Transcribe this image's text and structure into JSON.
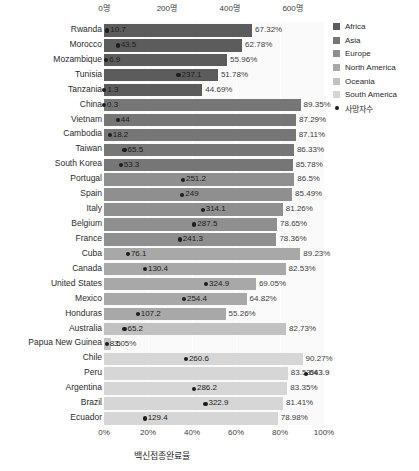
{
  "chart_data": {
    "type": "bar",
    "title": "",
    "xlabel": "백신접종완료율",
    "xlabel_top": "",
    "ylabel": "",
    "orientation": "horizontal",
    "xlim": [
      0,
      100
    ],
    "xlim_top": [
      0,
      700
    ],
    "grid": true,
    "legend_position": "right",
    "bottom_ticks": [
      "0%",
      "20%",
      "40%",
      "60%",
      "80%",
      "100%"
    ],
    "bottom_tick_values": [
      0,
      20,
      40,
      60,
      80,
      100
    ],
    "top_ticks": [
      "0명",
      "200명",
      "400명",
      "600명"
    ],
    "top_tick_values": [
      0,
      200,
      400,
      600
    ],
    "series": [
      {
        "name": "백신접종완료율",
        "unit": "%"
      },
      {
        "name": "사망자수",
        "unit": "명"
      }
    ],
    "categories": [
      "Rwanda",
      "Morocco",
      "Mozambique",
      "Tunisia",
      "Tanzania",
      "China",
      "Vietnam",
      "Cambodia",
      "Taiwan",
      "South Korea",
      "Portugal",
      "Spain",
      "Italy",
      "Belgium",
      "France",
      "Cuba",
      "Canada",
      "United States",
      "Mexico",
      "Honduras",
      "Australia",
      "Papua New Guinea",
      "Chile",
      "Peru",
      "Argentina",
      "Brazil",
      "Ecuador"
    ],
    "rows": [
      {
        "country": "Rwanda",
        "region": "Africa",
        "rate": 67.32,
        "rate_label": "67.32%",
        "deaths": 10.7,
        "deaths_label": "10.7"
      },
      {
        "country": "Morocco",
        "region": "Africa",
        "rate": 62.78,
        "rate_label": "62.78%",
        "deaths": 43.5,
        "deaths_label": "43.5"
      },
      {
        "country": "Mozambique",
        "region": "Africa",
        "rate": 55.96,
        "rate_label": "55.96%",
        "deaths": 6.9,
        "deaths_label": "6.9"
      },
      {
        "country": "Tunisia",
        "region": "Africa",
        "rate": 51.78,
        "rate_label": "51.78%",
        "deaths": 237.1,
        "deaths_label": "237.1"
      },
      {
        "country": "Tanzania",
        "region": "Africa",
        "rate": 44.69,
        "rate_label": "44.69%",
        "deaths": 1.3,
        "deaths_label": "1.3"
      },
      {
        "country": "China",
        "region": "Asia",
        "rate": 89.35,
        "rate_label": "89.35%",
        "deaths": 0.3,
        "deaths_label": "0.3"
      },
      {
        "country": "Vietnam",
        "region": "Asia",
        "rate": 87.29,
        "rate_label": "87.29%",
        "deaths": 44,
        "deaths_label": "44"
      },
      {
        "country": "Cambodia",
        "region": "Asia",
        "rate": 87.11,
        "rate_label": "87.11%",
        "deaths": 18.2,
        "deaths_label": "18.2"
      },
      {
        "country": "Taiwan",
        "region": "Asia",
        "rate": 86.33,
        "rate_label": "86.33%",
        "deaths": 65.5,
        "deaths_label": "65.5"
      },
      {
        "country": "South Korea",
        "region": "Asia",
        "rate": 85.78,
        "rate_label": "85.78%",
        "deaths": 53.3,
        "deaths_label": "53.3"
      },
      {
        "country": "Portugal",
        "region": "Europe",
        "rate": 86.5,
        "rate_label": "86.5%",
        "deaths": 251.2,
        "deaths_label": "251.2"
      },
      {
        "country": "Spain",
        "region": "Europe",
        "rate": 85.49,
        "rate_label": "85.49%",
        "deaths": 249,
        "deaths_label": "249"
      },
      {
        "country": "Italy",
        "region": "Europe",
        "rate": 81.26,
        "rate_label": "81.26%",
        "deaths": 314.1,
        "deaths_label": "314.1"
      },
      {
        "country": "Belgium",
        "region": "Europe",
        "rate": 78.65,
        "rate_label": "78.65%",
        "deaths": 287.5,
        "deaths_label": "287.5"
      },
      {
        "country": "France",
        "region": "Europe",
        "rate": 78.36,
        "rate_label": "78.36%",
        "deaths": 241.3,
        "deaths_label": "241.3"
      },
      {
        "country": "Cuba",
        "region": "North America",
        "rate": 89.23,
        "rate_label": "89.23%",
        "deaths": 76.1,
        "deaths_label": "76.1"
      },
      {
        "country": "Canada",
        "region": "North America",
        "rate": 82.53,
        "rate_label": "82.53%",
        "deaths": 130.4,
        "deaths_label": "130.4"
      },
      {
        "country": "United States",
        "region": "North America",
        "rate": 69.05,
        "rate_label": "69.05%",
        "deaths": 324.9,
        "deaths_label": "324.9"
      },
      {
        "country": "Mexico",
        "region": "North America",
        "rate": 64.82,
        "rate_label": "64.82%",
        "deaths": 254.4,
        "deaths_label": "254.4"
      },
      {
        "country": "Honduras",
        "region": "North America",
        "rate": 55.26,
        "rate_label": "55.26%",
        "deaths": 107.2,
        "deaths_label": "107.2"
      },
      {
        "country": "Australia",
        "region": "Oceania",
        "rate": 82.73,
        "rate_label": "82.73%",
        "deaths": 65.2,
        "deaths_label": "65.2"
      },
      {
        "country": "Papua New Guinea",
        "region": "Oceania",
        "rate": 3.05,
        "rate_label": "3.05%",
        "deaths": 8.5,
        "deaths_label": "8.5"
      },
      {
        "country": "Chile",
        "region": "South America",
        "rate": 90.27,
        "rate_label": "90.27%",
        "deaths": 260.6,
        "deaths_label": "260.6"
      },
      {
        "country": "Peru",
        "region": "South America",
        "rate": 83.53,
        "rate_label": "83.53%",
        "deaths": 643.9,
        "deaths_label": "643.9"
      },
      {
        "country": "Argentina",
        "region": "South America",
        "rate": 83.35,
        "rate_label": "83.35%",
        "deaths": 286.2,
        "deaths_label": "286.2"
      },
      {
        "country": "Brazil",
        "region": "South America",
        "rate": 81.41,
        "rate_label": "81.41%",
        "deaths": 322.9,
        "deaths_label": "322.9"
      },
      {
        "country": "Ecuador",
        "region": "South America",
        "rate": 78.98,
        "rate_label": "78.98%",
        "deaths": 129.4,
        "deaths_label": "129.4"
      }
    ]
  },
  "legend": {
    "items": [
      {
        "label": "Africa",
        "color": "#5c5c5c",
        "marker": "square"
      },
      {
        "label": "Asia",
        "color": "#767676",
        "marker": "square"
      },
      {
        "label": "Europe",
        "color": "#8f8f8f",
        "marker": "square"
      },
      {
        "label": "North America",
        "color": "#a8a8a8",
        "marker": "square"
      },
      {
        "label": "Oceania",
        "color": "#c2c2c2",
        "marker": "square"
      },
      {
        "label": "South America",
        "color": "#d6d6d6",
        "marker": "square"
      },
      {
        "label": "사망자수",
        "color": "#1c1c1c",
        "marker": "dot"
      }
    ]
  },
  "colors": {
    "Africa": "#5c5c5c",
    "Asia": "#767676",
    "Europe": "#8f8f8f",
    "North America": "#a8a8a8",
    "Oceania": "#c2c2c2",
    "South America": "#d6d6d6",
    "dot": "#1c1c1c",
    "plot_background": "#fafafa",
    "gridline": "#ffffff"
  }
}
